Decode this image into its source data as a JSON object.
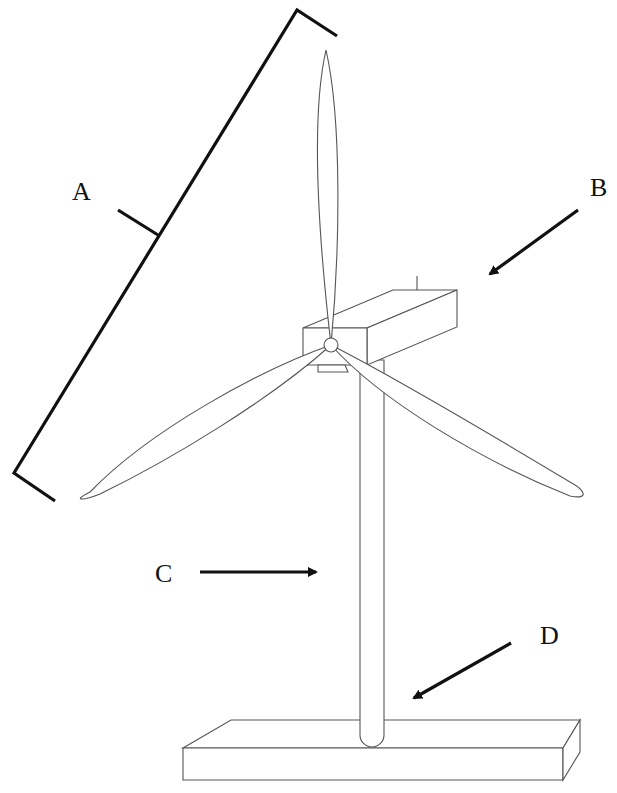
{
  "diagram": {
    "labels": [
      {
        "id": "A",
        "text": "A",
        "points_to": "blade length (bracket)"
      },
      {
        "id": "B",
        "text": "B",
        "points_to": "nacelle"
      },
      {
        "id": "C",
        "text": "C",
        "points_to": "tower"
      },
      {
        "id": "D",
        "text": "D",
        "points_to": "tower base joint"
      }
    ],
    "components": [
      "blade-top",
      "blade-left",
      "blade-right",
      "hub",
      "nacelle",
      "tower",
      "base"
    ],
    "colors": {
      "background": "#ffffff",
      "outline": "#555555",
      "annotation": "#111111"
    }
  }
}
